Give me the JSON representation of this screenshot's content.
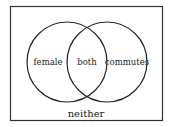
{
  "diagram": {
    "type": "venn",
    "sets": [
      {
        "label": "female"
      },
      {
        "label": "commutes"
      }
    ],
    "intersection_label": "both",
    "outside_label": "neither"
  }
}
